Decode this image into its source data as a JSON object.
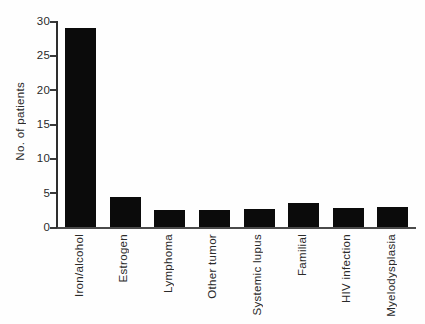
{
  "chart_data": {
    "type": "bar",
    "title": "",
    "xlabel": "",
    "ylabel": "No. of patients",
    "categories": [
      "Iron/alcohol",
      "Estrogen",
      "Lymphoma",
      "Other tumor",
      "Systemic lupus",
      "Familial",
      "HIV infection",
      "Myelodysplasia"
    ],
    "values": [
      29,
      4.4,
      2.5,
      2.5,
      2.6,
      3.5,
      2.7,
      2.9
    ],
    "ylim": [
      0,
      30
    ],
    "yticks": [
      0,
      5,
      10,
      15,
      20,
      25,
      30
    ],
    "grid": false,
    "legend": null,
    "x_tick_label_rotation_deg": 90,
    "bar_color": "#0b0b0b",
    "axis_color": "#3a3a3a",
    "background_color": "#fefefe"
  }
}
